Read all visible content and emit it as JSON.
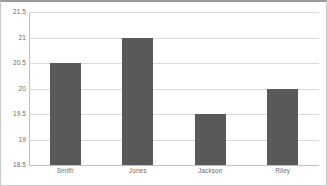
{
  "chart_data": {
    "type": "bar",
    "title": "",
    "subtitle": "",
    "xlabel": "",
    "ylabel": "",
    "categories": [
      "Smith",
      "Jones",
      "Jackson",
      "Riley"
    ],
    "values": [
      20.5,
      21,
      19.5,
      20
    ],
    "ylim": [
      18.5,
      21.5
    ],
    "ytick_step": 0.5,
    "ytick_labels": [
      "18.5",
      "19",
      "19.5",
      "20",
      "20.5",
      "21",
      "21.5"
    ],
    "ytick_values": [
      18.5,
      19,
      19.5,
      20,
      20.5,
      21,
      21.5
    ],
    "grid": true,
    "grid_axis": "y",
    "legend": false,
    "legend_position": "none",
    "bar_color": "#595959",
    "grid_color": "#d9d9d9",
    "axis_color": "#bfbfbf",
    "label_color": "#6b6b6b",
    "background_color": "#ffffff",
    "frame_color": "#c8c8c8"
  }
}
